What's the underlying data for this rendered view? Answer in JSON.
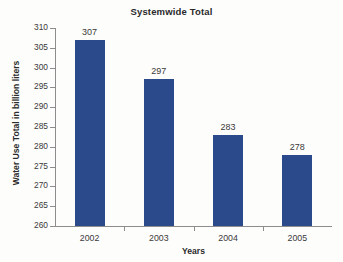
{
  "chart_data": {
    "type": "bar",
    "title": "Systemwide Total",
    "xlabel": "Years",
    "ylabel": "Water Use Total in billion liters",
    "categories": [
      "2002",
      "2003",
      "2004",
      "2005"
    ],
    "values": [
      307,
      297,
      283,
      278
    ],
    "value_labels": [
      "307",
      "297",
      "283",
      "278"
    ],
    "ylim": [
      260,
      310
    ],
    "ytick_step": 5,
    "ytick_labels": [
      "310",
      "305",
      "300",
      "295",
      "290",
      "285",
      "280",
      "275",
      "270",
      "265",
      "260"
    ],
    "grid": false,
    "legend": null,
    "series": [
      {
        "name": "Systemwide Total",
        "values": [
          307,
          297,
          283,
          278
        ],
        "color": "#2b4a8b"
      }
    ],
    "colors": {
      "bar": "#2b4a8b",
      "axis": "#8d8d8d",
      "text": "#3a3a3a",
      "title": "#2a2a2a",
      "background": "#fdfdfc"
    }
  }
}
